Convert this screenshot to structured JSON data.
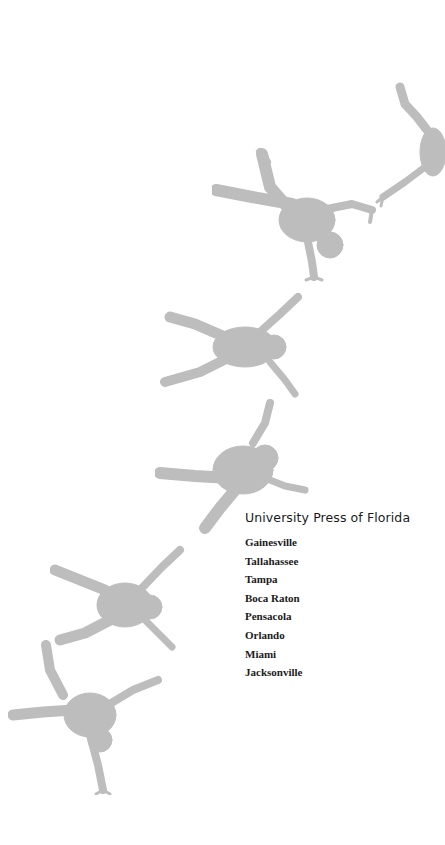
{
  "imprint": {
    "publisher": "University Press of Florida",
    "cities": [
      "Gainesville",
      "Tallahassee",
      "Tampa",
      "Boca Raton",
      "Pensacola",
      "Orlando",
      "Miami",
      "Jacksonville"
    ]
  },
  "illustration": {
    "description": "Sequence of gray cartwheeling figure silhouettes arcing from bottom-left to top-right",
    "figure_count": 6,
    "color": "#bdbdbd"
  }
}
